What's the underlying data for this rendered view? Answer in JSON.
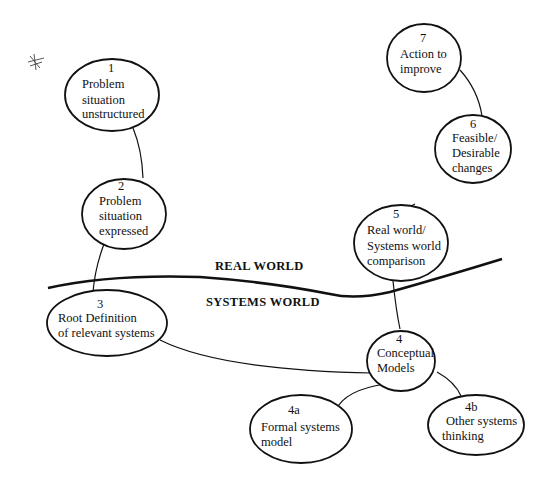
{
  "diagram": {
    "type": "soft-systems-methodology-cycle",
    "regions": {
      "upper": "REAL WORLD",
      "lower": "SYSTEMS WORLD"
    },
    "nodes": [
      {
        "id": "1",
        "number": "1",
        "lines": [
          "Problem",
          "situation",
          "unstructured"
        ]
      },
      {
        "id": "2",
        "number": "2",
        "lines": [
          "Problem",
          "situation",
          "expressed"
        ]
      },
      {
        "id": "3",
        "number": "3",
        "lines": [
          "Root Definition",
          "of relevant systems"
        ]
      },
      {
        "id": "4",
        "number": "4",
        "lines": [
          "Conceptual",
          "Models"
        ]
      },
      {
        "id": "4a",
        "number": "4a",
        "lines": [
          "Formal systems",
          "model"
        ]
      },
      {
        "id": "4b",
        "number": "4b",
        "lines": [
          "Other systems",
          "thinking"
        ]
      },
      {
        "id": "5",
        "number": "5",
        "lines": [
          "Real world/",
          "Systems world",
          "comparison"
        ]
      },
      {
        "id": "6",
        "number": "6",
        "lines": [
          "Feasible/",
          "Desirable",
          "changes"
        ]
      },
      {
        "id": "7",
        "number": "7",
        "lines": [
          "Action to",
          "improve"
        ]
      }
    ],
    "edges": [
      [
        "1",
        "2"
      ],
      [
        "2",
        "3"
      ],
      [
        "3",
        "4"
      ],
      [
        "4",
        "4a"
      ],
      [
        "4",
        "4b"
      ],
      [
        "4",
        "5"
      ],
      [
        "5",
        "6"
      ],
      [
        "6",
        "7"
      ]
    ],
    "annotation": "hand-drawn star mark"
  }
}
